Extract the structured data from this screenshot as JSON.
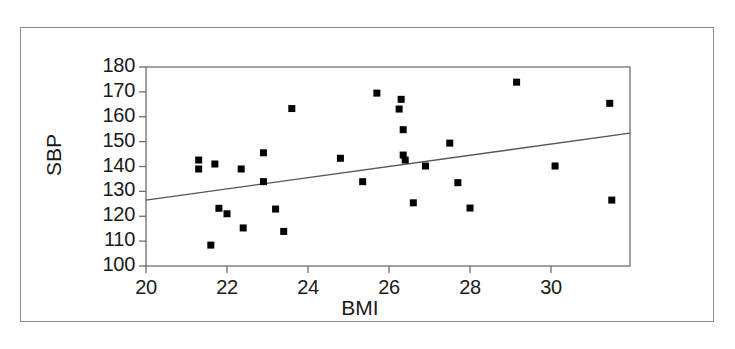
{
  "chart_data": {
    "type": "scatter",
    "title": "",
    "xlabel": "BMI",
    "ylabel": "SBP",
    "xlim": [
      20,
      31.95
    ],
    "ylim": [
      100,
      180
    ],
    "xticks": [
      20,
      22,
      24,
      26,
      28,
      30
    ],
    "yticks": [
      100,
      110,
      120,
      130,
      140,
      150,
      160,
      170,
      180
    ],
    "grid": false,
    "legend": null,
    "marker": "filled-square",
    "marker_color": "#000000",
    "points": [
      {
        "x": 21.3,
        "y": 142.6
      },
      {
        "x": 21.3,
        "y": 139.0
      },
      {
        "x": 21.7,
        "y": 141.0
      },
      {
        "x": 21.6,
        "y": 108.4
      },
      {
        "x": 21.8,
        "y": 123.2
      },
      {
        "x": 22.0,
        "y": 121.0
      },
      {
        "x": 22.35,
        "y": 139.0
      },
      {
        "x": 22.4,
        "y": 115.3
      },
      {
        "x": 22.9,
        "y": 145.5
      },
      {
        "x": 22.9,
        "y": 133.9
      },
      {
        "x": 23.2,
        "y": 122.9
      },
      {
        "x": 23.4,
        "y": 113.9
      },
      {
        "x": 23.6,
        "y": 163.3
      },
      {
        "x": 24.8,
        "y": 143.3
      },
      {
        "x": 25.35,
        "y": 133.9
      },
      {
        "x": 25.7,
        "y": 169.5
      },
      {
        "x": 26.3,
        "y": 167.0
      },
      {
        "x": 26.25,
        "y": 163.1
      },
      {
        "x": 26.35,
        "y": 154.8
      },
      {
        "x": 26.35,
        "y": 144.6
      },
      {
        "x": 26.4,
        "y": 142.6
      },
      {
        "x": 26.9,
        "y": 140.2
      },
      {
        "x": 26.6,
        "y": 125.4
      },
      {
        "x": 27.5,
        "y": 149.4
      },
      {
        "x": 27.7,
        "y": 133.5
      },
      {
        "x": 28.0,
        "y": 123.3
      },
      {
        "x": 29.15,
        "y": 173.9
      },
      {
        "x": 30.1,
        "y": 140.2
      },
      {
        "x": 31.45,
        "y": 165.4
      },
      {
        "x": 31.5,
        "y": 126.5
      }
    ],
    "regression_line": {
      "x_start": 20.0,
      "y_start": 126.5,
      "x_end": 31.95,
      "y_end": 153.4,
      "color": "#555555"
    }
  },
  "axis": {
    "y_title": "SBP",
    "x_title": "BMI",
    "y_tick_labels": [
      "180",
      "170",
      "160",
      "150",
      "140",
      "130",
      "120",
      "110",
      "100"
    ],
    "x_tick_labels": [
      "20",
      "22",
      "24",
      "26",
      "28",
      "30"
    ]
  },
  "colors": {
    "frame": "#8d8d8d",
    "axis": "#6f6f6f",
    "marker": "#000000",
    "line": "#555555",
    "text": "#1a1a1a",
    "background": "#ffffff"
  }
}
